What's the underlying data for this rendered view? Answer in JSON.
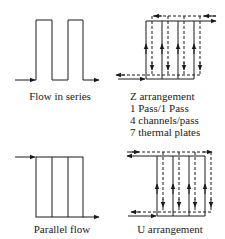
{
  "diagrams": {
    "series": {
      "label": "Flow in series"
    },
    "z": {
      "label": "Z arrangement",
      "details": [
        "1 Pass/1 Pass",
        "4 channels/pass",
        "7 thermal plates"
      ]
    },
    "parallel": {
      "label": "Parallel flow"
    },
    "u": {
      "label": "U arrangement"
    }
  },
  "colors": {
    "line": "#1a1a1a",
    "background": "#ffffff"
  }
}
